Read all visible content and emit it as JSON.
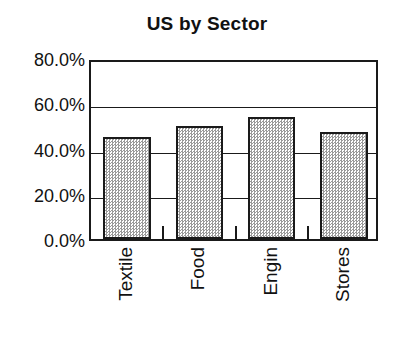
{
  "chart_data": {
    "type": "bar",
    "title": "US by Sector",
    "xlabel": "",
    "ylabel": "",
    "categories": [
      "Textile",
      "Food",
      "Engin",
      "Stores"
    ],
    "values": [
      45.0,
      50.0,
      54.0,
      47.5
    ],
    "ylim": [
      0.0,
      80.0
    ],
    "ytick_values": [
      80.0,
      60.0,
      40.0,
      20.0,
      0.0
    ],
    "ytick_labels": [
      "80.0%",
      "60.0%",
      "40.0%",
      "20.0%",
      "0.0%"
    ],
    "grid": true,
    "grid_axis": "y",
    "legend": false,
    "legend_position": "none",
    "series": [
      {
        "name": "US by Sector",
        "values": [
          45.0,
          50.0,
          54.0,
          47.5
        ]
      }
    ],
    "bar_style": {
      "fill": "#d0d0d0",
      "pattern": "checkered-dither-gray",
      "edge_color": "#1a1a1a"
    },
    "axis_color": "#1a1a1a",
    "background": "#ffffff"
  }
}
